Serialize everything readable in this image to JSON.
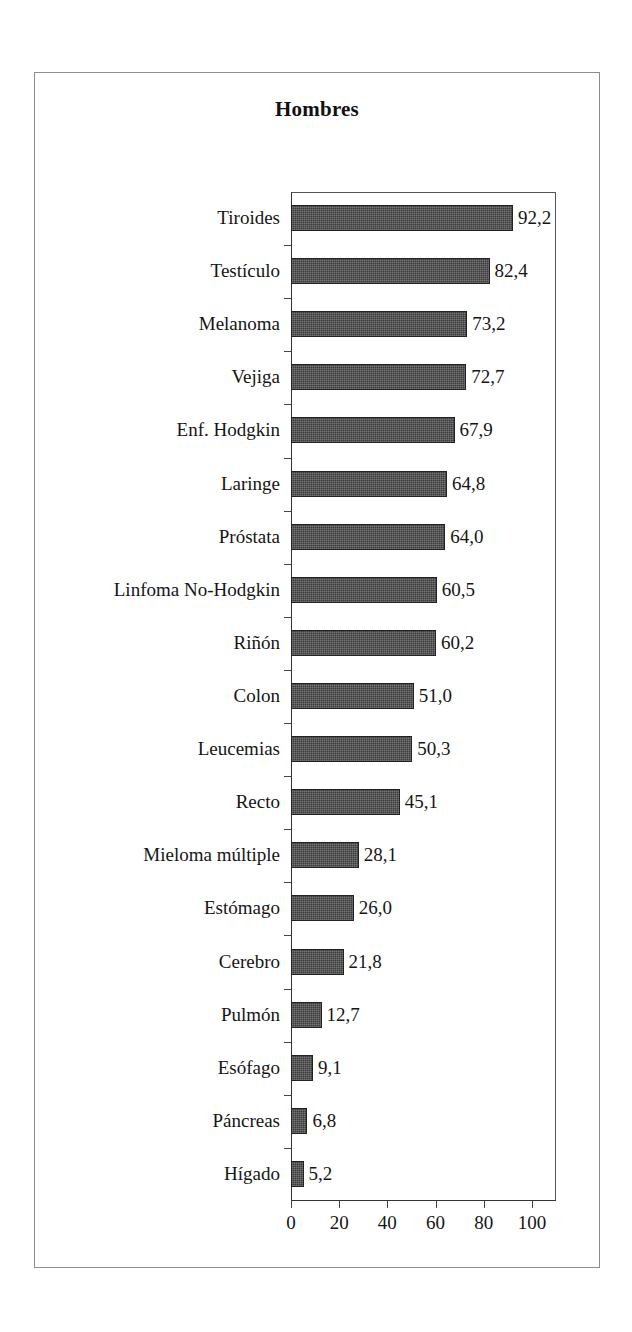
{
  "chart_data": {
    "type": "bar",
    "orientation": "horizontal",
    "title": "Hombres",
    "xlabel": "",
    "ylabel": "",
    "xlim": [
      0,
      110
    ],
    "xticks": [
      0,
      20,
      40,
      60,
      80,
      100
    ],
    "xtick_labels": [
      "0",
      "20",
      "40",
      "60",
      "80",
      "100"
    ],
    "grid": false,
    "legend": null,
    "decimal_separator": ",",
    "categories": [
      "Tiroides",
      "Testículo",
      "Melanoma",
      "Vejiga",
      "Enf. Hodgkin",
      "Laringe",
      "Próstata",
      "Linfoma No-Hodgkin",
      "Riñón",
      "Colon",
      "Leucemias",
      "Recto",
      "Mieloma múltiple",
      "Estómago",
      "Cerebro",
      "Pulmón",
      "Esófago",
      "Páncreas",
      "Hígado"
    ],
    "values": [
      92.2,
      82.4,
      73.2,
      72.7,
      67.9,
      64.8,
      64.0,
      60.5,
      60.2,
      51.0,
      50.3,
      45.1,
      28.1,
      26.0,
      21.8,
      12.7,
      9.1,
      6.8,
      5.2
    ],
    "value_labels": [
      "92,2",
      "82,4",
      "73,2",
      "72,7",
      "67,9",
      "64,8",
      "64,0",
      "60,5",
      "60,2",
      "51,0",
      "50,3",
      "45,1",
      "28,1",
      "26,0",
      "21,8",
      "12,7",
      "9,1",
      "6,8",
      "5,2"
    ],
    "bar_color": "#3c3c3c",
    "bar_edge_color": "#222222",
    "background_color": "#ffffff",
    "frame_color": "#8d8d8d"
  }
}
